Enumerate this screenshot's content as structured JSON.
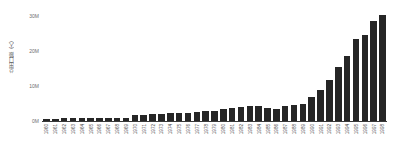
{
  "chart_data": {
    "type": "bar",
    "title": "",
    "subtitle": "",
    "xlabel": "",
    "ylabel": "总出口额（人）",
    "ylim": [
      0,
      32000000
    ],
    "grid": false,
    "legend": false,
    "legend_position": "none",
    "bar_color": "#262626",
    "axis_color": "#3a3a3a",
    "tick_label_color": "#4a4a4a",
    "ytick_labels": [
      "30M",
      "20M",
      "10M",
      "0M"
    ],
    "ytick_values": [
      30000000,
      20000000,
      10000000,
      0
    ],
    "categories": [
      "1960",
      "1961",
      "1962",
      "1963",
      "1964",
      "1965",
      "1966",
      "1967",
      "1968",
      "1969",
      "1970",
      "1971",
      "1972",
      "1973",
      "1974",
      "1975",
      "1976",
      "1977",
      "1978",
      "1979",
      "1980",
      "1981",
      "1982",
      "1983",
      "1984",
      "1985",
      "1986",
      "1987",
      "1988",
      "1989",
      "1990",
      "1991",
      "1992",
      "1993",
      "1994",
      "1995",
      "1996",
      "1997",
      "1998"
    ],
    "values": [
      700000,
      700000,
      750000,
      750000,
      800000,
      800000,
      850000,
      900000,
      950000,
      1000000,
      1600000,
      1700000,
      1900000,
      2000000,
      2200000,
      2300000,
      2400000,
      2600000,
      2800000,
      3000000,
      3400000,
      3700000,
      4100000,
      4300000,
      4300000,
      3800000,
      3500000,
      4200000,
      4700000,
      5000000,
      6900000,
      9000000,
      11800000,
      15400000,
      18600000,
      23500000,
      24500000,
      28700000,
      30400000
    ]
  }
}
